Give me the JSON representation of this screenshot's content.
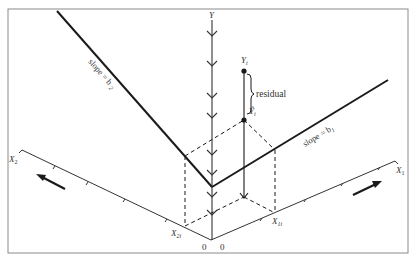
{
  "diagram": {
    "axes": {
      "y_label": "Y",
      "x1_label": "X",
      "x1_sub": "1",
      "x2_label": "X",
      "x2_sub": "2",
      "origin_left": "0",
      "origin_right": "0"
    },
    "lines": {
      "slope_b1_label": "slope = b",
      "slope_b1_sub": "1",
      "slope_b2_label": "slope = b",
      "slope_b2_sub": "2"
    },
    "points": {
      "observed_label": "Y",
      "observed_sub": "i",
      "predicted_label": "Ŷ",
      "predicted_sub": "i",
      "residual_label": "residual",
      "x1i_label": "X",
      "x1i_sub": "1i",
      "x2i_label": "X",
      "x2i_sub": "2i"
    },
    "colors": {
      "line": "#1a1a1a",
      "frame": "#888888",
      "text": "#333333"
    }
  }
}
